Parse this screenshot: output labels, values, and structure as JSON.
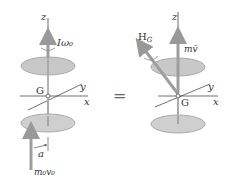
{
  "left_diagram": {
    "labels": {
      "z": "z",
      "omega": "Iω₀",
      "G": "G",
      "y": "y",
      "x": "x",
      "a": "a",
      "impulse": "m₀v₀"
    }
  },
  "equals": "=",
  "right_diagram": {
    "labels": {
      "z": "z",
      "HG": "H",
      "HG_sub": "G",
      "mv": "mv̄",
      "G": "G",
      "y": "y",
      "x": "x"
    }
  },
  "colors": {
    "disk_fill": "#c8c8c8",
    "disk_stroke": "#9a9a9a",
    "arrow": "#9e9e9e",
    "axis": "#333333"
  }
}
